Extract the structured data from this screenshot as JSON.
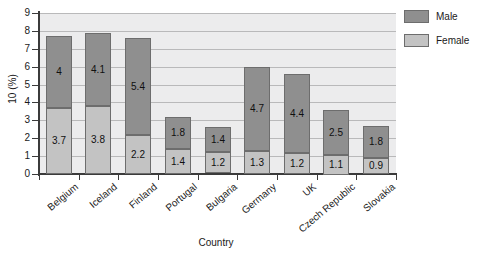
{
  "chart_data": {
    "type": "bar",
    "subtype": "stacked-column",
    "title": "",
    "xlabel": "Country",
    "ylabel": "10 (%)",
    "ylim": [
      0,
      9
    ],
    "ytick_labels": [
      "0",
      "1",
      "2",
      "3",
      "4",
      "5",
      "6",
      "7",
      "8",
      "9"
    ],
    "grid": "horizontal",
    "legend_position": "right-top",
    "categories": [
      "Belgium",
      "Iceland",
      "Finland",
      "Portugal",
      "Bulgaria",
      "Germany",
      "UK",
      "Czech Republic",
      "Slovakia"
    ],
    "series": [
      {
        "name": "Female",
        "color": "#c3c3c3",
        "stack_position": "bottom",
        "values": [
          3.7,
          3.8,
          2.2,
          1.4,
          1.2,
          1.3,
          1.2,
          1.1,
          0.9
        ],
        "labels": [
          "3.7",
          "3.8",
          "2.2",
          "1.4",
          "1.2",
          "1.3",
          "1.2",
          "1.1",
          "0.9"
        ]
      },
      {
        "name": "Male",
        "color": "#8f8f8f",
        "stack_position": "top",
        "values": [
          4.0,
          4.1,
          5.4,
          1.8,
          1.4,
          4.7,
          4.4,
          2.5,
          1.8
        ],
        "labels": [
          "4",
          "4.1",
          "5.4",
          "1.8",
          "1.4",
          "4.7",
          "4.4",
          "2.5",
          "1.8"
        ]
      }
    ],
    "totals": [
      7.7,
      7.9,
      7.6,
      3.2,
      2.6,
      6.0,
      5.6,
      3.6,
      2.7
    ]
  },
  "legend": {
    "items": [
      {
        "label": "Male",
        "color": "#8f8f8f"
      },
      {
        "label": "Female",
        "color": "#c3c3c3"
      }
    ]
  },
  "axes": {
    "x_title": "Country",
    "y_title": "10 (%)"
  },
  "colors": {
    "male": "#8f8f8f",
    "female": "#c3c3c3",
    "plot_background": "#ececed",
    "gridline": "#b9b9ba",
    "axis": "#3b3b3b",
    "text": "#1a1a1a"
  }
}
